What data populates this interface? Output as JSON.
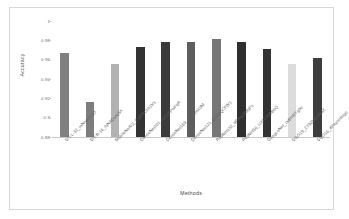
{
  "chart_data": {
    "type": "bar",
    "title": "",
    "xlabel": "Methods",
    "ylabel": "Accuracy",
    "ylim": [
      0.88,
      1
    ],
    "yticks": [
      "0.88",
      "0.9",
      "0.92",
      "0.94",
      "0.96",
      "0.98",
      "1"
    ],
    "ytick_values": [
      0.88,
      0.9,
      0.92,
      0.94,
      0.96,
      0.98,
      1
    ],
    "grid": false,
    "legend": "none",
    "categories": [
      "ViT-L-32_mNnpcXrzJ",
      "ViT-B-16_tqNADwvjSk",
      "MobileNetV2_CqlPPCns1Vs",
      "DenseNet201_eUQXPwFqR",
      "DenseNet169_sG4bmXdM",
      "DenseNet121_buGvQCPjV1",
      "ResNet152_ttPRqtJ8lIqFs",
      "ResNet50_UXFzrDBBsQ",
      "GoogLeNet_cvBlnEFg9e",
      "VGG19_2Y9ZbDx9vaX",
      "VGG16_4PAzsmIsgo"
    ],
    "values": [
      0.967,
      0.916,
      0.956,
      0.973,
      0.978,
      0.978,
      0.981,
      0.978,
      0.971,
      0.956,
      0.962
    ],
    "bar_colors": [
      "#808080",
      "#7d7d7d",
      "#b2b2b2",
      "#333333",
      "#3a3a3a",
      "#5e5e5e",
      "#767676",
      "#2f2f2f",
      "#333333",
      "#dcdcdc",
      "#3d3d3d"
    ]
  },
  "axes": {
    "xlabel": "Methods",
    "ylabel": "Accuracy"
  }
}
